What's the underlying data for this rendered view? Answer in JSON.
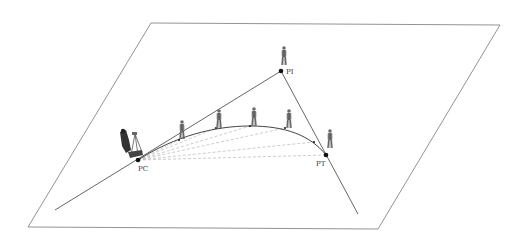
{
  "diagram": {
    "type": "horizontal-curve-layout",
    "points": {
      "PC": {
        "label": "PC",
        "x": 138,
        "y": 160
      },
      "PI": {
        "label": "PI",
        "x": 281,
        "y": 71
      },
      "PT": {
        "label": "PT",
        "x": 326,
        "y": 155
      }
    },
    "curve_stations": [
      {
        "x": 179,
        "y": 140
      },
      {
        "x": 216,
        "y": 128
      },
      {
        "x": 250,
        "y": 126
      },
      {
        "x": 285,
        "y": 128
      },
      {
        "x": 314,
        "y": 142
      }
    ],
    "figures": [
      {
        "role": "instrument-operator",
        "x": 127,
        "y": 148
      },
      {
        "role": "rodman",
        "x": 182,
        "y": 120
      },
      {
        "role": "rodman",
        "x": 219,
        "y": 110
      },
      {
        "role": "rodman",
        "x": 254,
        "y": 108
      },
      {
        "role": "rodman",
        "x": 289,
        "y": 110
      },
      {
        "role": "rodman-at-PI",
        "x": 284,
        "y": 50
      },
      {
        "role": "rodman-near-PT",
        "x": 330,
        "y": 133
      }
    ],
    "colors": {
      "line": "#555555",
      "chord": "#aaaaaa",
      "point": "#111111",
      "figure": "#6b6b6b"
    }
  }
}
